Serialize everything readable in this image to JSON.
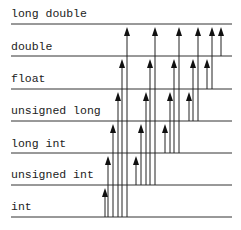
{
  "diagram": {
    "types": [
      {
        "label": "long double",
        "y": 24
      },
      {
        "label": "double",
        "y": 56
      },
      {
        "label": "float",
        "y": 89
      },
      {
        "label": "unsigned long",
        "y": 121
      },
      {
        "label": "long int",
        "y": 153
      },
      {
        "label": "unsigned int",
        "y": 185
      },
      {
        "label": "int",
        "y": 217
      }
    ],
    "arrows": [
      {
        "from": "int",
        "to": "unsigned int",
        "x": 105
      },
      {
        "from": "int",
        "to": "long int",
        "x": 108
      },
      {
        "from": "int",
        "to": "unsigned long",
        "x": 113
      },
      {
        "from": "int",
        "to": "float",
        "x": 118
      },
      {
        "from": "int",
        "to": "double",
        "x": 122
      },
      {
        "from": "int",
        "to": "long double",
        "x": 127
      },
      {
        "from": "unsigned int",
        "to": "long int",
        "x": 136
      },
      {
        "from": "unsigned int",
        "to": "unsigned long",
        "x": 141
      },
      {
        "from": "unsigned int",
        "to": "float",
        "x": 146
      },
      {
        "from": "unsigned int",
        "to": "double",
        "x": 150
      },
      {
        "from": "unsigned int",
        "to": "long double",
        "x": 155
      },
      {
        "from": "long int",
        "to": "unsigned long",
        "x": 165
      },
      {
        "from": "long int",
        "to": "float",
        "x": 170
      },
      {
        "from": "long int",
        "to": "double",
        "x": 174
      },
      {
        "from": "long int",
        "to": "long double",
        "x": 179
      },
      {
        "from": "unsigned long",
        "to": "float",
        "x": 189
      },
      {
        "from": "unsigned long",
        "to": "double",
        "x": 193
      },
      {
        "from": "unsigned long",
        "to": "long double",
        "x": 198
      },
      {
        "from": "float",
        "to": "double",
        "x": 207
      },
      {
        "from": "float",
        "to": "long double",
        "x": 212
      },
      {
        "from": "double",
        "to": "long double",
        "x": 221
      }
    ]
  },
  "labels": {
    "long_double": "long double",
    "double": "double",
    "float": "float",
    "unsigned_long": "unsigned long",
    "long_int": "long int",
    "unsigned_int": "unsigned int",
    "int": "int"
  }
}
